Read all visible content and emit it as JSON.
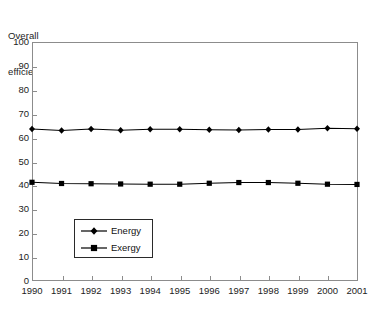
{
  "chart_data": {
    "type": "line",
    "title": "",
    "axis_title_lines": [
      "Overall",
      "efficiency (%)"
    ],
    "ylabel": "Overall efficiency (%)",
    "xlabel": "",
    "ylim": [
      0,
      100
    ],
    "yticks": [
      0,
      10,
      20,
      30,
      40,
      50,
      60,
      70,
      80,
      90,
      100
    ],
    "grid": false,
    "legend_position": "inside lower-left",
    "categories": [
      "1990",
      "1991",
      "1992",
      "1993",
      "1994",
      "1995",
      "1996",
      "1997",
      "1998",
      "1999",
      "2000",
      "2001"
    ],
    "x": [
      1990,
      1991,
      1992,
      1993,
      1994,
      1995,
      1996,
      1997,
      1998,
      1999,
      2000,
      2001
    ],
    "series": [
      {
        "name": "Energy",
        "marker": "diamond",
        "color": "#000000",
        "values": [
          63.6,
          63.0,
          63.6,
          63.1,
          63.5,
          63.5,
          63.3,
          63.2,
          63.4,
          63.4,
          63.9,
          63.7
        ]
      },
      {
        "name": "Exergy",
        "marker": "square",
        "color": "#000000",
        "values": [
          41.3,
          40.8,
          40.7,
          40.6,
          40.5,
          40.5,
          40.9,
          41.2,
          41.2,
          40.9,
          40.5,
          40.4
        ]
      }
    ]
  },
  "legend": {
    "items": [
      {
        "label": "Energy",
        "marker": "diamond-marker"
      },
      {
        "label": "Exergy",
        "marker": "square-marker"
      }
    ]
  },
  "colors": {
    "line": "#000000",
    "frame": "#8c8c8c",
    "text": "#1c1c1c",
    "background": "#ffffff"
  }
}
